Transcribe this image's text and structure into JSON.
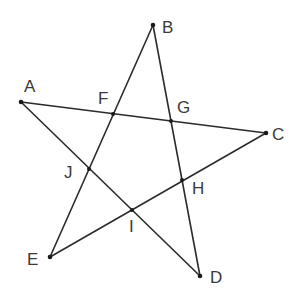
{
  "diagram": {
    "type": "pentagram",
    "line_color": "#2b2b2b",
    "label_color": "#3a3a3a",
    "points": {
      "A": {
        "label": "A",
        "x": 21,
        "y": 102
      },
      "B": {
        "label": "B",
        "x": 153,
        "y": 25
      },
      "C": {
        "label": "C",
        "x": 266,
        "y": 133
      },
      "D": {
        "label": "D",
        "x": 200,
        "y": 276
      },
      "E": {
        "label": "E",
        "x": 50,
        "y": 257
      },
      "F": {
        "label": "F",
        "x": 113,
        "y": 114
      },
      "G": {
        "label": "G",
        "x": 171,
        "y": 121
      },
      "H": {
        "label": "H",
        "x": 182,
        "y": 180
      },
      "I": {
        "label": "I",
        "x": 132,
        "y": 210
      },
      "J": {
        "label": "J",
        "x": 89,
        "y": 169
      }
    },
    "segments": [
      [
        "A",
        "C"
      ],
      [
        "C",
        "E"
      ],
      [
        "E",
        "B"
      ],
      [
        "B",
        "D"
      ],
      [
        "D",
        "A"
      ]
    ]
  }
}
